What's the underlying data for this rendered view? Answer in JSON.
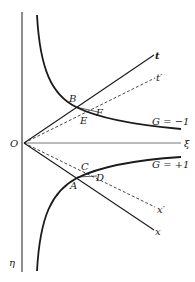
{
  "diagram": {
    "type": "minkowski-hyperbola-diagram",
    "colors": {
      "ink": "#1a1a1a",
      "background": "#ffffff"
    },
    "axes": {
      "origin_label": "O",
      "vertical_axis_label": "η",
      "horizontal_axis_label": "ξ"
    },
    "lines": {
      "t": {
        "label": "t",
        "style": "solid"
      },
      "t_prime": {
        "label": "t′",
        "style": "dashed"
      },
      "x": {
        "label": "x",
        "style": "solid"
      },
      "x_prime": {
        "label": "x′",
        "style": "dashed"
      }
    },
    "curves": {
      "upper": {
        "label": "G = −1",
        "style": "solid-thick"
      },
      "lower": {
        "label": "G = +1",
        "style": "solid-thick"
      }
    },
    "points": {
      "A": "A",
      "B": "B",
      "C": "C",
      "D": "D",
      "E": "E",
      "F": "F"
    }
  }
}
